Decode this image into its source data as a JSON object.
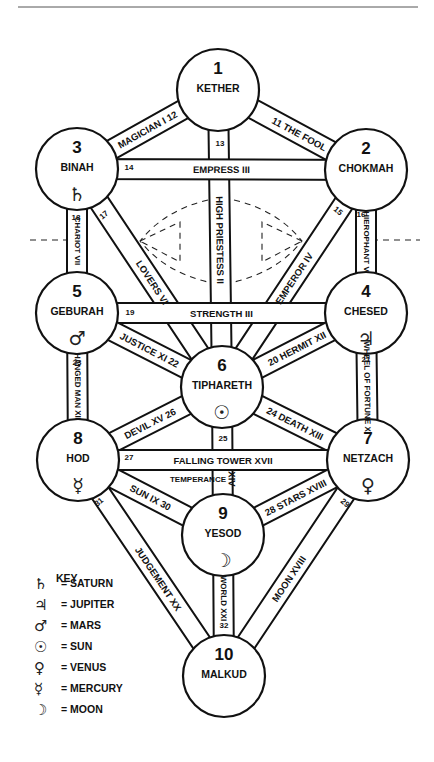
{
  "diagram": {
    "top_rule": {
      "x1": 18,
      "x2": 418,
      "y": 7
    },
    "daath_dashes": {
      "horizontal_y": 240,
      "left_segment": [
        30,
        72
      ],
      "right_segment": [
        372,
        420
      ]
    },
    "nodes": [
      {
        "id": 1,
        "number": "1",
        "name": "KETHER",
        "cx": 218,
        "cy": 90,
        "r": 41,
        "symbol": ""
      },
      {
        "id": 2,
        "number": "2",
        "name": "CHOKMAH",
        "cx": 366,
        "cy": 170,
        "r": 41,
        "symbol": ""
      },
      {
        "id": 3,
        "number": "3",
        "name": "BINAH",
        "cx": 77,
        "cy": 169,
        "r": 41,
        "symbol": "♄",
        "planet": "saturn"
      },
      {
        "id": 4,
        "number": "4",
        "name": "CHESED",
        "cx": 366,
        "cy": 313,
        "r": 41,
        "symbol": "♃",
        "planet": "jupiter"
      },
      {
        "id": 5,
        "number": "5",
        "name": "GEBURAH",
        "cx": 77,
        "cy": 313,
        "r": 41,
        "symbol": "♂",
        "planet": "mars"
      },
      {
        "id": 6,
        "number": "6",
        "name": "TIPHARETH",
        "cx": 222,
        "cy": 387,
        "r": 41,
        "symbol": "☉",
        "planet": "sun"
      },
      {
        "id": 7,
        "number": "7",
        "name": "NETZACH",
        "cx": 368,
        "cy": 460,
        "r": 41,
        "symbol": "♀",
        "planet": "venus"
      },
      {
        "id": 8,
        "number": "8",
        "name": "HOD",
        "cx": 78,
        "cy": 460,
        "r": 41,
        "symbol": "☿",
        "planet": "mercury"
      },
      {
        "id": 9,
        "number": "9",
        "name": "YESOD",
        "cx": 223,
        "cy": 535,
        "r": 41,
        "symbol": "☽",
        "planet": "moon"
      },
      {
        "id": 10,
        "number": "10",
        "name": "MALKUD",
        "cx": 224,
        "cy": 676,
        "r": 41,
        "symbol": ""
      }
    ],
    "paths": [
      {
        "num": "11",
        "label": "THE FOOL",
        "from": 1,
        "to": 2,
        "text": "11   THE FOOL"
      },
      {
        "num": "12",
        "label": "MAGICIAN I",
        "from": 3,
        "to": 1,
        "text": "MAGICIAN I 12"
      },
      {
        "num": "13",
        "label": "HIGH PRIESTESS II",
        "from": 1,
        "to": 6,
        "text": "HIGH PRIESTESS II"
      },
      {
        "num": "14",
        "label": "EMPRESS III",
        "from": 3,
        "to": 2,
        "text": "EMPRESS III"
      },
      {
        "num": "15",
        "label": "EMPEROR IV",
        "from": 2,
        "to": 6,
        "text": "EMPEROR IV"
      },
      {
        "num": "16",
        "label": "HIEROPHANT V",
        "from": 2,
        "to": 4,
        "text": "HIEROPHANT V"
      },
      {
        "num": "17",
        "label": "LOVERS VI",
        "from": 3,
        "to": 6,
        "text": "LOVERS VI"
      },
      {
        "num": "18",
        "label": "CHARIOT VII",
        "from": 3,
        "to": 5,
        "text": "CHARIOT VII"
      },
      {
        "num": "19",
        "label": "STRENGTH III",
        "from": 5,
        "to": 4,
        "text": "STRENGTH III"
      },
      {
        "num": "20",
        "label": "HERMIT XII",
        "from": 6,
        "to": 4,
        "text": "20 HERMIT XII"
      },
      {
        "num": "21",
        "label": "WHEEL OF FORTUNE X",
        "from": 4,
        "to": 7,
        "text": "WHEEL OF FORTUNE X"
      },
      {
        "num": "22",
        "label": "JUSTICE XI",
        "from": 5,
        "to": 6,
        "text": "JUSTICE XI 22"
      },
      {
        "num": "23",
        "label": "HANGED MAN XII",
        "from": 5,
        "to": 8,
        "text": "HANGED MAN XII"
      },
      {
        "num": "24",
        "label": "DEATH XIII",
        "from": 6,
        "to": 7,
        "text": "24 DEATH XIII"
      },
      {
        "num": "25",
        "label": "TEMPERANCE XIV",
        "from": 6,
        "to": 9,
        "text": "XIV"
      },
      {
        "num": "26",
        "label": "DEVIL XV",
        "from": 8,
        "to": 6,
        "text": "DEVIL XV 26"
      },
      {
        "num": "27",
        "label": "FALLING TOWER XVII",
        "from": 8,
        "to": 7,
        "text": "FALLING TOWER XVII"
      },
      {
        "num": "28",
        "label": "STARS XVIII",
        "from": 9,
        "to": 7,
        "text": "28 STARS XVIII"
      },
      {
        "num": "29",
        "label": "MOON XVIII",
        "from": 7,
        "to": 10,
        "text": "MOON XVIII"
      },
      {
        "num": "30",
        "label": "SUN IX",
        "from": 8,
        "to": 9,
        "text": "SUN IX    30"
      },
      {
        "num": "31",
        "label": "JUDGEMENT XX",
        "from": 8,
        "to": 10,
        "text": "JUDGEMENT XX"
      },
      {
        "num": "32",
        "label": "WORLD XXI",
        "from": 9,
        "to": 10,
        "text": "WORLD XXI"
      }
    ],
    "extra_labels": {
      "temperance": "TEMPERANCE",
      "n13": "13",
      "n14": "14",
      "n16": "16",
      "n17": "17",
      "n18": "18",
      "n19": "19",
      "n21": "21",
      "n23": "23",
      "n25": "25",
      "n27": "27",
      "n29": "29",
      "n31": "31",
      "n32": "32",
      "n15": "15"
    }
  },
  "key": {
    "title": "KEY",
    "items": [
      {
        "symbol": "♄",
        "label": "= SATURN"
      },
      {
        "symbol": "♃",
        "label": "= JUPITER"
      },
      {
        "symbol": "♂",
        "label": "= MARS"
      },
      {
        "symbol": "☉",
        "label": "= SUN"
      },
      {
        "symbol": "♀",
        "label": "= VENUS"
      },
      {
        "symbol": "☿",
        "label": "= MERCURY"
      },
      {
        "symbol": "☽",
        "label": "= MOON"
      }
    ]
  }
}
